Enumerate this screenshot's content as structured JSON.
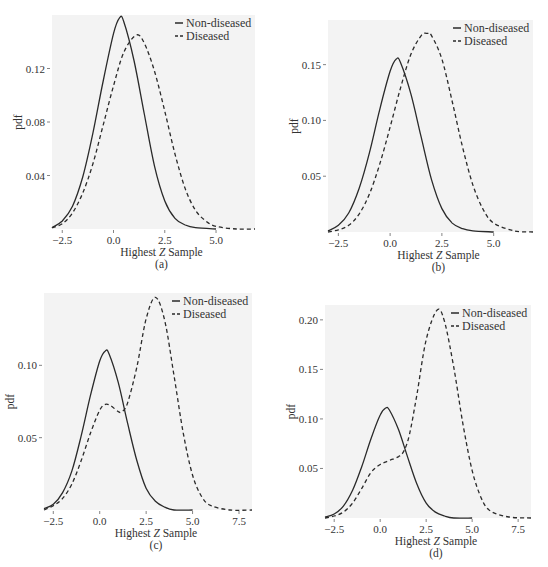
{
  "chart_data": [
    {
      "type": "line",
      "panel_label": "(a)",
      "xlabel": "Highest Z Sample",
      "ylabel": "pdf",
      "xticks": [
        -2.5,
        0.0,
        2.5,
        5.0
      ],
      "xtick_labels": [
        "-2.5",
        "0.0",
        "2.5",
        "5.0"
      ],
      "yticks": [
        0.04,
        0.08,
        0.12
      ],
      "ytick_labels": [
        "0.04",
        "0.08",
        "0.12"
      ],
      "xlim": [
        -3.0,
        6.9
      ],
      "ylim": [
        0,
        0.16
      ],
      "legend": [
        "Non-diseased",
        "Diseased"
      ],
      "legend_position": "top-right",
      "series": [
        {
          "name": "Non-diseased",
          "style": "solid",
          "x": [
            -3.0,
            -2.5,
            -2.0,
            -1.5,
            -1.0,
            -0.5,
            0.0,
            0.3,
            0.5,
            1.0,
            1.5,
            2.0,
            2.5,
            3.0,
            3.5,
            4.0,
            5.0
          ],
          "y": [
            0.001,
            0.006,
            0.017,
            0.039,
            0.072,
            0.111,
            0.146,
            0.158,
            0.155,
            0.126,
            0.086,
            0.047,
            0.021,
            0.008,
            0.003,
            0.001,
            0.0
          ]
        },
        {
          "name": "Diseased",
          "style": "dashed",
          "x": [
            -3.0,
            -2.5,
            -2.0,
            -1.5,
            -1.0,
            -0.5,
            0.0,
            0.5,
            1.1,
            1.5,
            2.0,
            2.5,
            3.0,
            3.5,
            4.0,
            4.5,
            5.0,
            6.0,
            6.9
          ],
          "y": [
            0.001,
            0.004,
            0.012,
            0.027,
            0.049,
            0.078,
            0.107,
            0.132,
            0.145,
            0.139,
            0.118,
            0.088,
            0.056,
            0.03,
            0.014,
            0.006,
            0.002,
            0.0,
            0.0
          ]
        }
      ]
    },
    {
      "type": "line",
      "panel_label": "(b)",
      "xlabel": "Highest Z Sample",
      "ylabel": "pdf",
      "xticks": [
        -2.5,
        0.0,
        2.5,
        5.0
      ],
      "xtick_labels": [
        "-2.5",
        "0.0",
        "2.5",
        "5.0"
      ],
      "yticks": [
        0.05,
        0.1,
        0.15
      ],
      "ytick_labels": [
        "0.05",
        "0.10",
        "0.15"
      ],
      "xlim": [
        -3.0,
        6.9
      ],
      "ylim": [
        0,
        0.19
      ],
      "legend": [
        "Non-diseased",
        "Diseased"
      ],
      "legend_position": "top-right",
      "series": [
        {
          "name": "Non-diseased",
          "style": "solid",
          "x": [
            -3.0,
            -2.5,
            -2.0,
            -1.5,
            -1.0,
            -0.5,
            0.0,
            0.3,
            0.5,
            1.0,
            1.5,
            2.0,
            2.5,
            3.0,
            3.5,
            4.0,
            5.0
          ],
          "y": [
            0.001,
            0.006,
            0.017,
            0.039,
            0.071,
            0.11,
            0.144,
            0.155,
            0.152,
            0.124,
            0.085,
            0.047,
            0.021,
            0.008,
            0.003,
            0.001,
            0.0
          ]
        },
        {
          "name": "Diseased",
          "style": "dashed",
          "x": [
            -3.0,
            -2.5,
            -2.0,
            -1.5,
            -1.0,
            -0.5,
            0.0,
            0.5,
            1.0,
            1.5,
            1.8,
            2.0,
            2.5,
            3.0,
            3.5,
            4.0,
            4.5,
            5.0,
            6.0,
            6.9
          ],
          "y": [
            0.0,
            0.002,
            0.006,
            0.016,
            0.034,
            0.061,
            0.094,
            0.129,
            0.159,
            0.176,
            0.178,
            0.176,
            0.155,
            0.117,
            0.076,
            0.042,
            0.02,
            0.008,
            0.001,
            0.0
          ]
        }
      ]
    },
    {
      "type": "line",
      "panel_label": "(c)",
      "xlabel": "Highest Z Sample",
      "ylabel": "pdf",
      "xticks": [
        -2.5,
        0.0,
        2.5,
        5.0,
        7.5
      ],
      "xtick_labels": [
        "-2.5",
        "0.0",
        "2.5",
        "5.0",
        "7.5"
      ],
      "yticks": [
        0.05,
        0.1
      ],
      "ytick_labels": [
        "0.05",
        "0.10"
      ],
      "xlim": [
        -3.0,
        8.2
      ],
      "ylim": [
        0,
        0.15
      ],
      "legend": [
        "Non-diseased",
        "Diseased"
      ],
      "legend_position": "top-right",
      "series": [
        {
          "name": "Non-diseased",
          "style": "solid",
          "x": [
            -3.0,
            -2.5,
            -2.0,
            -1.5,
            -1.0,
            -0.5,
            0.0,
            0.3,
            0.5,
            1.0,
            1.5,
            2.0,
            2.5,
            3.0,
            3.5,
            4.0,
            5.0
          ],
          "y": [
            0.001,
            0.004,
            0.012,
            0.027,
            0.051,
            0.079,
            0.103,
            0.11,
            0.108,
            0.088,
            0.06,
            0.034,
            0.015,
            0.006,
            0.002,
            0.0,
            0.0
          ]
        },
        {
          "name": "Diseased",
          "style": "dashed",
          "x": [
            -3.0,
            -2.5,
            -2.0,
            -1.5,
            -1.0,
            -0.5,
            0.0,
            0.3,
            0.6,
            1.0,
            1.2,
            1.5,
            2.0,
            2.5,
            3.0,
            3.5,
            4.0,
            4.5,
            5.0,
            5.5,
            6.0,
            7.0,
            8.2
          ],
          "y": [
            0.0,
            0.003,
            0.008,
            0.018,
            0.034,
            0.053,
            0.069,
            0.073,
            0.072,
            0.068,
            0.068,
            0.074,
            0.099,
            0.132,
            0.147,
            0.131,
            0.093,
            0.053,
            0.024,
            0.009,
            0.003,
            0.0,
            0.0
          ]
        }
      ]
    },
    {
      "type": "line",
      "panel_label": "(d)",
      "xlabel": "Highest Z Sample",
      "ylabel": "pdf",
      "xticks": [
        -2.5,
        0.0,
        2.5,
        5.0,
        7.5
      ],
      "xtick_labels": [
        "-2.5",
        "0.0",
        "2.5",
        "5.0",
        "7.5"
      ],
      "yticks": [
        0.05,
        0.1,
        0.15,
        0.2
      ],
      "ytick_labels": [
        "0.05",
        "0.10",
        "0.15",
        "0.20"
      ],
      "xlim": [
        -3.0,
        8.2
      ],
      "ylim": [
        0,
        0.215
      ],
      "legend": [
        "Non-diseased",
        "Diseased"
      ],
      "legend_position": "top-right",
      "series": [
        {
          "name": "Non-diseased",
          "style": "solid",
          "x": [
            -3.0,
            -2.5,
            -2.0,
            -1.5,
            -1.0,
            -0.5,
            0.0,
            0.3,
            0.5,
            1.0,
            1.5,
            2.0,
            2.5,
            3.0,
            3.5,
            4.0,
            5.0
          ],
          "y": [
            0.001,
            0.004,
            0.012,
            0.028,
            0.052,
            0.08,
            0.104,
            0.111,
            0.109,
            0.089,
            0.061,
            0.034,
            0.015,
            0.006,
            0.002,
            0.0,
            0.0
          ]
        },
        {
          "name": "Diseased",
          "style": "dashed",
          "x": [
            -3.0,
            -2.5,
            -2.0,
            -1.5,
            -1.0,
            -0.5,
            0.0,
            0.5,
            1.0,
            1.3,
            1.6,
            2.0,
            2.5,
            3.1,
            3.5,
            4.0,
            4.5,
            5.0,
            5.5,
            6.0,
            7.0,
            8.2
          ],
          "y": [
            0.0,
            0.002,
            0.006,
            0.015,
            0.03,
            0.046,
            0.054,
            0.058,
            0.062,
            0.068,
            0.085,
            0.125,
            0.18,
            0.21,
            0.198,
            0.152,
            0.095,
            0.048,
            0.02,
            0.007,
            0.001,
            0.0
          ]
        }
      ]
    }
  ]
}
